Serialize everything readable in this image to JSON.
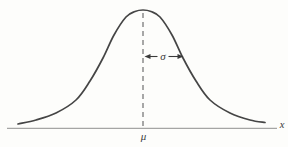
{
  "figure": {
    "background_color": "#fdfdfb",
    "curve_color": "#454545",
    "axis_color": "#8f8f8f",
    "dash_color": "#6f6f6f",
    "text_color": "#3a3a3a",
    "labels": {
      "sigma": "σ",
      "mu": "μ",
      "x_axis": "x"
    },
    "curve_points": [
      [
        18,
        124
      ],
      [
        36,
        120
      ],
      [
        56,
        113
      ],
      [
        76,
        100
      ],
      [
        90,
        81
      ],
      [
        103,
        58
      ],
      [
        114,
        35
      ],
      [
        126,
        17
      ],
      [
        135,
        11.5
      ],
      [
        143,
        10
      ],
      [
        151,
        11.5
      ],
      [
        160,
        17
      ],
      [
        172,
        35
      ],
      [
        183,
        58
      ],
      [
        196,
        81
      ],
      [
        210,
        100
      ],
      [
        230,
        113
      ],
      [
        250,
        120
      ],
      [
        265,
        122.5
      ]
    ],
    "axis_line": {
      "x1": 7,
      "x2": 277,
      "y": 128.3
    },
    "mean_line": {
      "x": 143,
      "y1": 13,
      "y2": 128
    },
    "sigma_arrow": {
      "y": 56.5,
      "left_head_points": "144.5,56.5 150.5,54.1 150.5,58.9",
      "right_head_points": "183.5,56.5 177.5,54.1 177.5,58.9",
      "left_segment": {
        "x1": 149.5,
        "x2": 157.5
      },
      "right_segment": {
        "x1": 168.5,
        "x2": 178.5
      },
      "label_x": 163,
      "label_y": 60
    },
    "mu_label": {
      "x": 143.5,
      "y": 139.5
    },
    "x_label": {
      "x": 282,
      "y": 128
    }
  }
}
